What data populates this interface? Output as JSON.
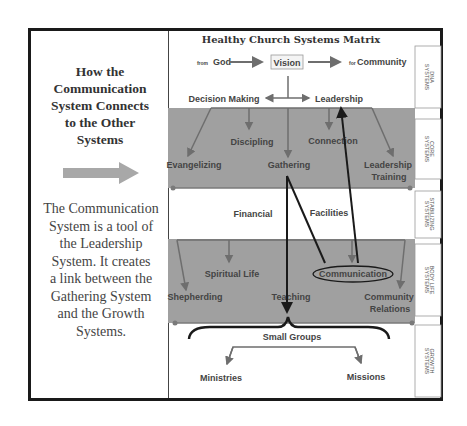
{
  "left_panel": {
    "title_lines": [
      "How the",
      "Communication",
      "System Connects",
      "to the Other",
      "Systems"
    ],
    "arrow_icon": "right-arrow",
    "description_lines": [
      "The Communication",
      "System is a tool of",
      "the Leadership",
      "System. It creates",
      "a link between the",
      "Gathering System",
      "and the Growth",
      "Systems."
    ]
  },
  "matrix": {
    "title": "Healthy Church Systems Matrix",
    "top_row": {
      "from_prefix": "from",
      "from": "God",
      "center": "Vision",
      "to_prefix": "for",
      "to": "Community"
    },
    "dna": {
      "left": "Decision Making",
      "right": "Leadership"
    },
    "core": [
      "Evangelizing",
      "Discipling",
      "Gathering",
      "Connection",
      "Leadership",
      "Training"
    ],
    "stabilizing": [
      "Financial",
      "Facilities"
    ],
    "body_life": [
      "Shepherding",
      "Spiritual Life",
      "Teaching",
      "Communication",
      "Community",
      "Relations"
    ],
    "growth": {
      "center": "Small Groups",
      "left": "Ministries",
      "right": "Missions"
    },
    "side_labels": [
      [
        "DNA",
        "SYSTEMS"
      ],
      [
        "CORE",
        "SYSTEMS"
      ],
      [
        "STABILIZING",
        "SYSTEMS"
      ],
      [
        "BODY LIFE",
        "SYSTEMS"
      ],
      [
        "GROWTH",
        "SYSTEMS"
      ]
    ],
    "colors": {
      "band": "#a0a0a0",
      "arrow": "#6e6e6e",
      "highlight": "#1a1a1a",
      "band_line": "#7a7a7a"
    }
  }
}
